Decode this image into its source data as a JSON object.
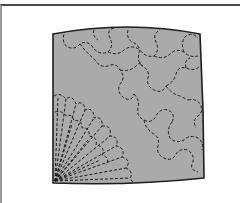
{
  "figure": {
    "panel_fill": "#aaaaaa",
    "outline_color": "#1e1e1e",
    "stitch_color": "#1a1a1a",
    "frame_top_color": "#4a4a4a",
    "frame_left_color": "#9a9a9a",
    "elements": [
      {
        "name": "quilt-panel",
        "label": "Fabric panel"
      },
      {
        "name": "fan-stitching",
        "label": "Fan quilting motif (lower-left corner)"
      },
      {
        "name": "cloud-stitching",
        "label": "Interlocking clamshell/cloud quilting motif (upper-right)"
      }
    ]
  }
}
